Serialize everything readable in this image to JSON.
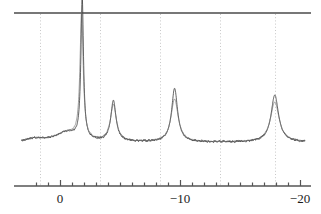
{
  "chart_data": {
    "type": "line",
    "title": "",
    "subtitle": "",
    "xlabel": "",
    "ylabel": "",
    "xlim": [
      3.0,
      -20.2
    ],
    "ylim": [
      0,
      1
    ],
    "x_axis_direction": "reversed",
    "grid": true,
    "grid_orientation": "vertical",
    "grid_style": "dotted",
    "legend": "none",
    "axis_tick_labels": [
      "0",
      "−10",
      "−20"
    ],
    "axis_tick_values": [
      0,
      -10,
      -20
    ],
    "minor_tick_values": [
      2,
      1,
      -1,
      -2,
      -3,
      -4,
      -5,
      -6,
      -7,
      -8,
      -9,
      -11,
      -12,
      -13,
      -14,
      -15,
      -16,
      -17,
      -18,
      -19
    ],
    "gridline_values": [
      1.7,
      -3.3,
      -8.3,
      -13.3,
      -17.9
    ],
    "baseline_level": 0.145,
    "noise_amplitude": 0.012,
    "top_rule_level": 1.0,
    "colors": {
      "trace_a": "#3a3a3a",
      "trace_b": "#6b6b6b",
      "axis": "#555555",
      "grid": "#c8c8c8",
      "top_rule": "#4a4a4a",
      "background": "#ffffff",
      "label": "#1a1a1a"
    },
    "series": [
      {
        "name": "trace_a",
        "peaks": [
          {
            "center": -1.85,
            "height": 0.985,
            "width": 0.13,
            "label": "peak-1"
          },
          {
            "center": -4.45,
            "height": 0.285,
            "width": 0.26,
            "label": "peak-2"
          },
          {
            "center": -9.55,
            "height": 0.375,
            "width": 0.3,
            "label": "peak-3"
          },
          {
            "center": -17.9,
            "height": 0.33,
            "width": 0.38,
            "label": "peak-4"
          }
        ]
      },
      {
        "name": "trace_b",
        "peaks": [
          {
            "center": -1.8,
            "height": 0.88,
            "width": 0.16,
            "label": "peak-1"
          },
          {
            "center": -4.45,
            "height": 0.255,
            "width": 0.3,
            "label": "peak-2"
          },
          {
            "center": -9.55,
            "height": 0.3,
            "width": 0.36,
            "label": "peak-3"
          },
          {
            "center": -17.9,
            "height": 0.28,
            "width": 0.44,
            "label": "peak-4"
          }
        ]
      }
    ],
    "broad_shoulders": [
      {
        "center": -0.55,
        "height": 0.065,
        "width": 1.1
      },
      {
        "center": 2.1,
        "height": 0.022,
        "width": 0.9
      }
    ]
  }
}
